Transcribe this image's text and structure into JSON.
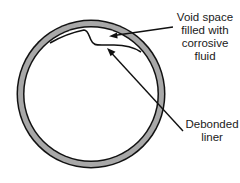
{
  "diagram": {
    "title": "",
    "labels": {
      "void": [
        "Void space",
        "filled with",
        "corrosive",
        "fluid"
      ],
      "liner": [
        "Debonded",
        "liner"
      ]
    },
    "colors": {
      "ring_fill": "#a8a8a8",
      "stroke": "#111111",
      "background": "#ffffff"
    }
  }
}
